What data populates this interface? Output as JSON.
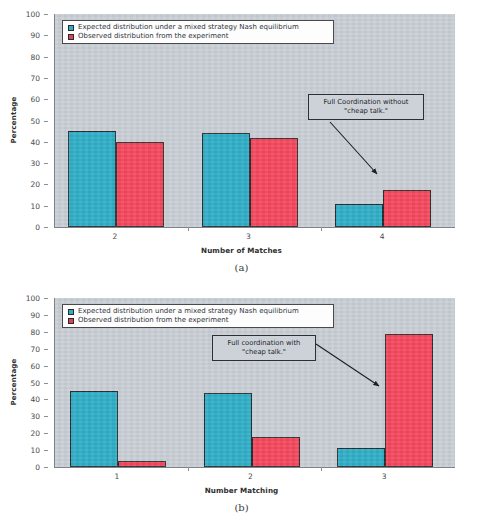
{
  "figure": {
    "panels": [
      {
        "caption": "(a)",
        "legend": [
          "Expected distribution under a mixed strategy Nash equilibrium",
          "Observed distribution from the experiment"
        ],
        "annotation": "Full Coordination without\n\"cheap talk.\"",
        "annotation_line1": "Full Coordination without",
        "annotation_line2": "\"cheap talk.\"",
        "chart_data": {
          "type": "bar",
          "title": "",
          "xlabel": "Number of Matches",
          "ylabel": "Percentage",
          "categories": [
            "2",
            "3",
            "4"
          ],
          "ylim": [
            0,
            100
          ],
          "yticks": [
            0,
            10,
            20,
            30,
            40,
            50,
            60,
            70,
            80,
            90,
            100
          ],
          "grid": false,
          "legend_position": "top-left",
          "series": [
            {
              "name": "Expected distribution under a mixed strategy Nash equilibrium",
              "color": "#2eadc6",
              "values": [
                45,
                44,
                11
              ]
            },
            {
              "name": "Observed distribution from the experiment",
              "color": "#f4465c",
              "values": [
                40,
                42,
                17.5
              ]
            }
          ],
          "annotations": [
            {
              "text": "Full Coordination without \"cheap talk.\"",
              "points_to_category": "4",
              "points_to_series": "Observed distribution from the experiment"
            }
          ]
        }
      },
      {
        "caption": "(b)",
        "legend": [
          "Expected distribution under a mixed strategy Nash equilibrium",
          "Observed distribution from the experiment"
        ],
        "annotation": "Full coordination with\n\"cheap talk.\"",
        "annotation_line1": "Full coordination with",
        "annotation_line2": "\"cheap talk.\"",
        "chart_data": {
          "type": "bar",
          "title": "",
          "xlabel": "Number Matching",
          "ylabel": "Percentage",
          "categories": [
            "1",
            "2",
            "3"
          ],
          "ylim": [
            0,
            100
          ],
          "yticks": [
            0,
            10,
            20,
            30,
            40,
            50,
            60,
            70,
            80,
            90,
            100
          ],
          "grid": false,
          "legend_position": "top-left",
          "series": [
            {
              "name": "Expected distribution under a mixed strategy Nash equilibrium",
              "color": "#2eadc6",
              "values": [
                45,
                44,
                11.5
              ]
            },
            {
              "name": "Observed distribution from the experiment",
              "color": "#f4465c",
              "values": [
                3.5,
                18,
                79
              ]
            }
          ],
          "annotations": [
            {
              "text": "Full coordination with \"cheap talk.\"",
              "points_to_category": "3",
              "points_to_series": "Observed distribution from the experiment"
            }
          ]
        }
      }
    ]
  }
}
